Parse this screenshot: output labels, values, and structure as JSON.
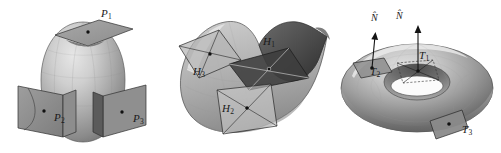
{
  "figure": {
    "caption": "",
    "background_color": "#ffffff",
    "ink_color": "#1a1a1a",
    "width": 501,
    "height": 153
  },
  "panels": [
    {
      "id": "ellipsoid",
      "surface_name": "ellipsoid",
      "description": "Egg-shaped ellipsoid surface with three tangent planes attached at marked points",
      "labels": [
        {
          "base": "P",
          "sub": "1",
          "x": 101,
          "y": 8
        },
        {
          "base": "P",
          "sub": "2",
          "x": 54,
          "y": 112
        },
        {
          "base": "P",
          "sub": "3",
          "x": 133,
          "y": 113
        }
      ]
    },
    {
      "id": "saddle",
      "surface_name": "saddle",
      "description": "Saddle-shaped surface with three tangent planes attached at marked points",
      "labels": [
        {
          "base": "H",
          "sub": "1",
          "x": 263,
          "y": 36
        },
        {
          "base": "H",
          "sub": "3",
          "x": 193,
          "y": 66
        },
        {
          "base": "H",
          "sub": "2",
          "x": 222,
          "y": 103
        }
      ]
    },
    {
      "id": "torus",
      "surface_name": "torus",
      "description": "Torus surface with three tangent planes and two unit normal vectors",
      "labels": [
        {
          "base": "T",
          "sub": "1",
          "x": 419,
          "y": 50
        },
        {
          "base": "T",
          "sub": "2",
          "x": 370,
          "y": 66
        },
        {
          "base": "T",
          "sub": "3",
          "x": 462,
          "y": 124
        }
      ],
      "normals": [
        {
          "text": "N̂",
          "x": 371,
          "y": 13
        },
        {
          "text": "N̂",
          "x": 396,
          "y": 11
        }
      ]
    }
  ],
  "colors": {
    "surface_light": "#d8d8d8",
    "surface_mid": "#a9a9a9",
    "surface_dark": "#6f6f6f",
    "surface_darkest": "#3a3a3a",
    "plane_fill": "#9a9a9a",
    "plane_fill_dark": "#4a4a4a",
    "plane_stroke": "#2b2b2b",
    "point": "#111111"
  }
}
